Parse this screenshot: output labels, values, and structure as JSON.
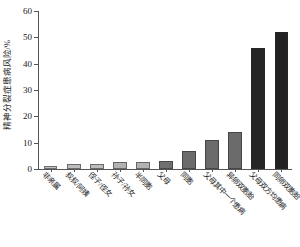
{
  "chart_data": {
    "type": "bar",
    "title": "",
    "xlabel": "",
    "ylabel": "精神分裂症患病风险/%",
    "ylim": [
      0,
      60
    ],
    "ytick_labels": [
      "0",
      "10",
      "20",
      "30",
      "40",
      "50",
      "60"
    ],
    "ytick_values": [
      0,
      10,
      20,
      30,
      40,
      50,
      60
    ],
    "grid": false,
    "legend": "none",
    "categories": [
      "非亲属",
      "叔叔/阿姨",
      "侄子/侄女",
      "孙子/孙女",
      "半同胞",
      "父母",
      "同胞",
      "父母其中一个患病",
      "异卵双胞胎",
      "父母双方均患病",
      "同卵双胞胎"
    ],
    "values": [
      1,
      2,
      2,
      2.5,
      2.5,
      3,
      7,
      11,
      14,
      46,
      52
    ],
    "bar_colors": [
      "#c2c2c2",
      "#bdbdbd",
      "#bcbcbc",
      "#b2b2b2",
      "#b2b2b2",
      "#6f6f6f",
      "#6b6b6b",
      "#6b6b6b",
      "#6b6b6b",
      "#262626",
      "#222222"
    ]
  }
}
